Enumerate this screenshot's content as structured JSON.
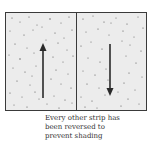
{
  "diagram": {
    "strips": [
      {
        "label": "strip-1",
        "arrow_direction": "up"
      },
      {
        "label": "strip-2",
        "arrow_direction": "down"
      }
    ],
    "caption": {
      "lines": [
        "Every other strip has",
        "been reversed to",
        "prevent shading"
      ]
    },
    "colors": {
      "background": "#ececec",
      "border": "#3a3a3a",
      "arrow": "#2a2a2a",
      "speckle": "#555555"
    }
  }
}
